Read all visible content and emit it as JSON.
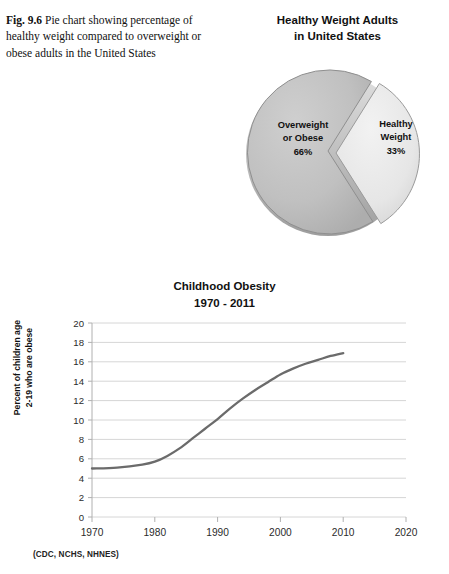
{
  "figure": {
    "label": "Fig. 9.6",
    "caption": "Pie chart showing percentage of healthy weight compared to overweight or obese adults in the United States"
  },
  "pie": {
    "title_line1": "Healthy Weight Adults",
    "title_line2": "in United States",
    "labels": {
      "overweight_line1": "Overweight",
      "overweight_line2": "or Obese",
      "overweight_value": "66%",
      "healthy_line1": "Healthy",
      "healthy_line2": "Weight",
      "healthy_value": "33%"
    }
  },
  "line": {
    "title_line1": "Childhood Obesity",
    "title_line2": "1970 - 2011",
    "y_axis_title_line1": "Percent of children age",
    "y_axis_title_line2": "2-19 who are obese",
    "source_note": "(CDC, NCHS, NHNES)"
  },
  "colors": {
    "slice_overweight": "#bdbdbd",
    "slice_healthy": "#e8e8e8",
    "slice_edge": "#8f8f8f",
    "line_series": "#6b6b6b",
    "gridline": "#d6d6d6",
    "axis": "#b0b0b0",
    "text": "#111111"
  },
  "chart_data": [
    {
      "type": "pie",
      "title": "Healthy Weight Adults in United States",
      "categories": [
        "Overweight or Obese",
        "Healthy Weight"
      ],
      "values": [
        66,
        33
      ],
      "value_labels": [
        "66%",
        "33%"
      ],
      "colors": [
        "#bdbdbd",
        "#e8e8e8"
      ],
      "exploded": [
        false,
        true
      ],
      "legend": "none",
      "start_angle_deg": 58,
      "direction": "counterclockwise"
    },
    {
      "type": "line",
      "title": "Childhood Obesity 1970 - 2011",
      "xlabel": "",
      "ylabel": "Percent of children age 2-19 who are obese",
      "xlim": [
        1970,
        2020
      ],
      "ylim": [
        0,
        20
      ],
      "xticks": [
        1970,
        1980,
        1990,
        2000,
        2010,
        2020
      ],
      "yticks": [
        0,
        2,
        4,
        6,
        8,
        10,
        12,
        14,
        16,
        18,
        20
      ],
      "grid": "horizontal",
      "legend": "none",
      "source": "(CDC, NCHS, NHNES)",
      "series": [
        {
          "name": "Percent of children age 2-19 who are obese",
          "color": "#6b6b6b",
          "x": [
            1970,
            1974,
            1978,
            1980,
            1982,
            1984,
            1986,
            1988,
            1990,
            1992,
            1994,
            1996,
            1998,
            2000,
            2002,
            2004,
            2006,
            2008,
            2010
          ],
          "y": [
            5.0,
            5.1,
            5.4,
            5.7,
            6.3,
            7.1,
            8.1,
            9.1,
            10.1,
            11.2,
            12.2,
            13.1,
            13.9,
            14.7,
            15.3,
            15.8,
            16.2,
            16.6,
            16.9
          ]
        }
      ]
    }
  ]
}
